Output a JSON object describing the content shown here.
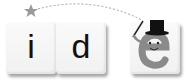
{
  "logo": {
    "letters": [
      "i",
      "d",
      "e"
    ],
    "colors": {
      "star": "#999999",
      "dash": "#999999",
      "mascot": "#8a8a8a",
      "hat": "#111111"
    },
    "icons": [
      "star-icon",
      "mascot-e-icon",
      "top-hat-icon",
      "wand-icon"
    ]
  }
}
